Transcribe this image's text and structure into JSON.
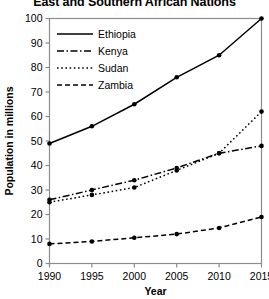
{
  "chart_data": {
    "type": "line",
    "title": "East and Southern African Nations",
    "xlabel": "Year",
    "ylabel": "Population in millions",
    "x": [
      1990,
      1995,
      2000,
      2005,
      2010,
      2015
    ],
    "xtick_labels": [
      "1990",
      "1995",
      "2000",
      "2005",
      "2010",
      "2015"
    ],
    "ytick_labels": [
      "0",
      "10",
      "20",
      "30",
      "40",
      "50",
      "60",
      "70",
      "80",
      "90",
      "100"
    ],
    "yticks": [
      0,
      10,
      20,
      30,
      40,
      50,
      60,
      70,
      80,
      90,
      100
    ],
    "xlim": [
      1990,
      2015
    ],
    "ylim": [
      0,
      100
    ],
    "grid": false,
    "legend_position": "upper-left-inside",
    "series": [
      {
        "name": "Ethiopia",
        "style": "solid",
        "dasharray": "",
        "values": [
          49,
          56,
          65,
          76,
          85,
          100
        ]
      },
      {
        "name": "Kenya",
        "style": "dash-dot",
        "dasharray": "7,2.5,1.5,2.5",
        "values": [
          26,
          30,
          34,
          39,
          45,
          48
        ]
      },
      {
        "name": "Sudan",
        "style": "dotted",
        "dasharray": "1.6,2.6",
        "values": [
          25,
          28,
          31,
          38,
          45,
          62
        ]
      },
      {
        "name": "Zambia",
        "style": "dashed",
        "dasharray": "5,3",
        "values": [
          8,
          9,
          10.5,
          12,
          14.5,
          19
        ]
      }
    ],
    "line_color": "#000000",
    "marker": "circle",
    "axis_color": "#8c8c8c"
  }
}
